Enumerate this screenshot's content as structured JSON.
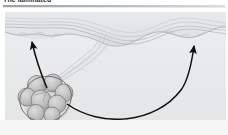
{
  "figure": {
    "header_title": "The laminated",
    "panel_background": "#ebecee",
    "page_background": "#ffffff",
    "rule_color": "#9aa0a6"
  },
  "illustration": {
    "type": "biological-diagram",
    "caption_alt": "Cell cluster attached by a twisted filamentous stalk to a wavy multilayered membrane, with curved arrows indicating movement",
    "elements": {
      "membrane": {
        "name": "wavy-membrane",
        "layer_count": 5,
        "line_color": "#b7bcc1",
        "fill_color": "#dfe1e4",
        "description": "undulating multi-layer sheet across the top that dips in the centre"
      },
      "cell_cluster": {
        "name": "cell-cluster",
        "lobe_count": 7,
        "outline_color": "#6e6e6e",
        "fill_color": "#c6c6c6",
        "position": "lower-left"
      },
      "stalk": {
        "name": "twisted-filament-stalk",
        "strand_count": 6,
        "line_color": "#c2c6ca",
        "description": "braided filaments linking the cluster to the membrane dip"
      },
      "arrow_left": {
        "name": "arrow-left-upward",
        "color": "#111111",
        "direction": "up"
      },
      "arrow_right": {
        "name": "arrow-right-upward",
        "color": "#111111",
        "direction": "up"
      },
      "arrow_sweep": {
        "name": "arrow-bottom-sweep",
        "color": "#111111",
        "direction": "right-then-up"
      }
    }
  }
}
